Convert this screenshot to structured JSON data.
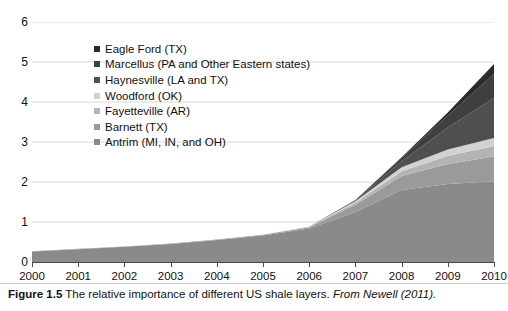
{
  "caption": {
    "figure_number": "Figure 1.5",
    "text": "The relative importance of different US shale layers.",
    "source": "From Newell (2011)."
  },
  "axes": {
    "y_ticks": [
      "0",
      "1",
      "2",
      "3",
      "4",
      "5",
      "6"
    ],
    "x_ticks": [
      "2000",
      "2001",
      "2002",
      "2003",
      "2004",
      "2005",
      "2006",
      "2007",
      "2008",
      "2009",
      "2010"
    ]
  },
  "legend": {
    "items": [
      {
        "label": "Eagle Ford (TX)",
        "color": "#2b2b2b"
      },
      {
        "label": "Marcellus (PA and Other Eastern states)",
        "color": "#3f3f3f"
      },
      {
        "label": "Haynesville (LA and TX)",
        "color": "#4f4f4f"
      },
      {
        "label": "Woodford (OK)",
        "color": "#d2d2d2"
      },
      {
        "label": "Fayetteville (AR)",
        "color": "#b4b4b4"
      },
      {
        "label": "Barnett (TX)",
        "color": "#9a9a9a"
      },
      {
        "label": "Antrim (MI, IN, and OH)",
        "color": "#8a8a8a"
      }
    ]
  },
  "chart_data": {
    "type": "area",
    "stacked": true,
    "title": "",
    "xlabel": "",
    "ylabel": "",
    "xlim": [
      2000,
      2010
    ],
    "ylim": [
      0,
      6
    ],
    "grid": true,
    "legend_position": "inside-top-left",
    "x": [
      2000,
      2001,
      2002,
      2003,
      2004,
      2005,
      2006,
      2007,
      2008,
      2009,
      2010
    ],
    "stack_order_bottom_to_top": [
      "Antrim (MI, IN, and OH)",
      "Barnett (TX)",
      "Fayetteville (AR)",
      "Woodford (OK)",
      "Haynesville (LA and TX)",
      "Marcellus (PA and Other Eastern states)",
      "Eagle Ford (TX)"
    ],
    "series": [
      {
        "name": "Antrim (MI, IN, and OH)",
        "color": "#8a8a8a",
        "values": [
          0.26,
          0.32,
          0.38,
          0.45,
          0.55,
          0.66,
          0.84,
          1.25,
          1.8,
          1.95,
          2.02
        ]
      },
      {
        "name": "Barnett (TX)",
        "color": "#9a9a9a",
        "values": [
          0.01,
          0.01,
          0.01,
          0.01,
          0.01,
          0.02,
          0.03,
          0.18,
          0.35,
          0.5,
          0.62
        ]
      },
      {
        "name": "Fayetteville (AR)",
        "color": "#b4b4b4",
        "values": [
          0.0,
          0.0,
          0.0,
          0.0,
          0.0,
          0.0,
          0.01,
          0.05,
          0.12,
          0.2,
          0.26
        ]
      },
      {
        "name": "Woodford (OK)",
        "color": "#d2d2d2",
        "values": [
          0.0,
          0.0,
          0.0,
          0.0,
          0.0,
          0.0,
          0.01,
          0.04,
          0.1,
          0.16,
          0.2
        ]
      },
      {
        "name": "Haynesville (LA and TX)",
        "color": "#4f4f4f",
        "values": [
          0.0,
          0.0,
          0.0,
          0.0,
          0.0,
          0.0,
          0.0,
          0.02,
          0.15,
          0.55,
          1.0
        ]
      },
      {
        "name": "Marcellus (PA and Other Eastern states)",
        "color": "#3f3f3f",
        "values": [
          0.0,
          0.0,
          0.0,
          0.0,
          0.0,
          0.0,
          0.0,
          0.01,
          0.08,
          0.3,
          0.6
        ]
      },
      {
        "name": "Eagle Ford (TX)",
        "color": "#2b2b2b",
        "values": [
          0.0,
          0.0,
          0.0,
          0.0,
          0.0,
          0.0,
          0.0,
          0.0,
          0.02,
          0.08,
          0.25
        ]
      }
    ],
    "totals": [
      0.27,
      0.33,
      0.39,
      0.46,
      0.56,
      0.68,
      0.9,
      1.55,
      2.62,
      3.74,
      4.95
    ]
  }
}
